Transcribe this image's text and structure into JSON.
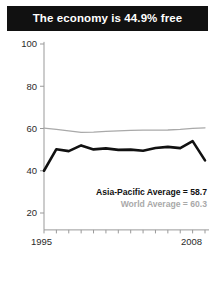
{
  "banner": {
    "title": "The economy is 44.9% free"
  },
  "annotations": {
    "asia_pacific": "Asia-Pacific Average = 58.7",
    "world": "World Average = 60.3"
  },
  "axis": {
    "y_ticks": [
      "100",
      "80",
      "60",
      "40",
      "20"
    ],
    "x_start": "1995",
    "x_end": "2008"
  },
  "colors": {
    "banner_bg": "#111111",
    "banner_text": "#ffffff",
    "country_line": "#111111",
    "world_line": "#a9a9a9",
    "axis": "#999999",
    "page_bg": "#ffffff"
  },
  "chart_data": {
    "type": "line",
    "title": "The economy is 44.9% free",
    "xlabel": "",
    "ylabel": "",
    "xlim": [
      1995,
      2008
    ],
    "ylim": [
      12,
      100
    ],
    "grid": false,
    "legend_position": "inside-right",
    "x": [
      1995,
      1996,
      1997,
      1998,
      1999,
      2000,
      2001,
      2002,
      2003,
      2004,
      2005,
      2006,
      2007,
      2008
    ],
    "y_ticks": [
      20,
      40,
      60,
      80,
      100
    ],
    "x_ticks": [
      1995,
      1996,
      1997,
      1998,
      1999,
      2000,
      2001,
      2002,
      2003,
      2004,
      2005,
      2006,
      2007,
      2008
    ],
    "series": [
      {
        "name": "Country score",
        "color": "#111111",
        "values": [
          40.0,
          50.2,
          49.3,
          52.0,
          50.1,
          50.6,
          49.9,
          50.0,
          49.5,
          50.8,
          51.3,
          50.7,
          54.0,
          44.9
        ]
      },
      {
        "name": "World Average",
        "color": "#a9a9a9",
        "values": [
          60.2,
          59.6,
          58.9,
          58.2,
          58.3,
          58.6,
          58.9,
          59.1,
          59.2,
          59.2,
          59.3,
          59.6,
          60.1,
          60.3
        ]
      }
    ],
    "annotations": [
      {
        "text": "Asia-Pacific Average = 58.7",
        "color": "#111111"
      },
      {
        "text": "World Average = 60.3",
        "color": "#a9a9a9"
      }
    ]
  }
}
